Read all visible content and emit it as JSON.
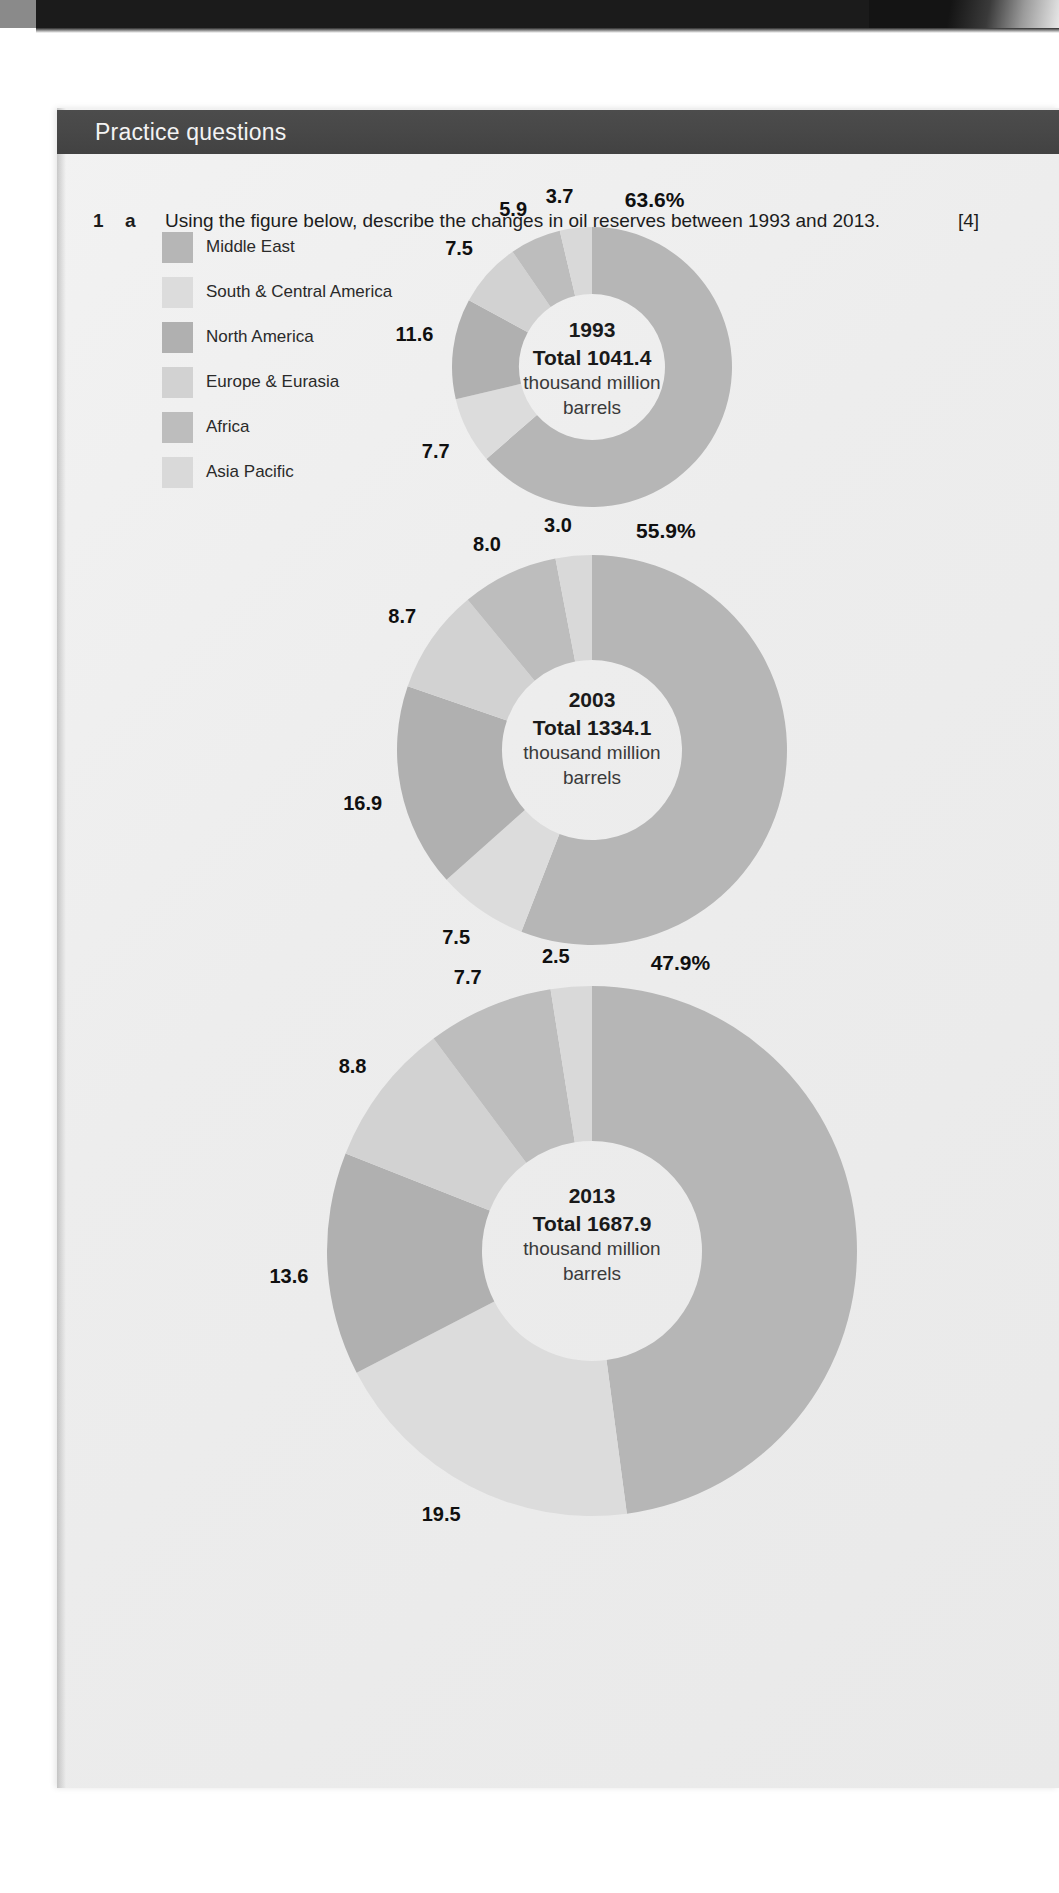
{
  "header": {
    "title": "Practice questions"
  },
  "question": {
    "number": "1",
    "sub": "a",
    "text": "Using the figure below, describe the changes in oil reserves between 1993 and 2013.",
    "marks": "[4]"
  },
  "legend": {
    "items": [
      {
        "label": "Middle East",
        "color": "#b6b6b6"
      },
      {
        "label": "South & Central America",
        "color": "#dcdcdc"
      },
      {
        "label": "North America",
        "color": "#b0b0b0"
      },
      {
        "label": "Europe & Eurasia",
        "color": "#d2d2d2"
      },
      {
        "label": "Africa",
        "color": "#bdbdbd"
      },
      {
        "label": "Asia Pacific",
        "color": "#d9d9d9"
      }
    ]
  },
  "chart_data": [
    {
      "type": "pie",
      "title": "1993",
      "center_lines": [
        "1993",
        "Total 1041.4",
        "thousand million",
        "barrels"
      ],
      "total": "1041.4",
      "unit": "thousand million barrels",
      "categories": [
        "Middle East",
        "South & Central America",
        "North America",
        "Europe & Eurasia",
        "Africa",
        "Asia Pacific"
      ],
      "values": [
        63.6,
        7.7,
        11.6,
        7.5,
        5.9,
        3.7
      ],
      "labels": [
        "63.6%",
        "7.7",
        "11.6",
        "7.5",
        "5.9",
        "3.7"
      ],
      "colors": [
        "#b6b6b6",
        "#dcdcdc",
        "#b0b0b0",
        "#d2d2d2",
        "#bdbdbd",
        "#d9d9d9"
      ],
      "legend_position": "left",
      "donut": true
    },
    {
      "type": "pie",
      "title": "2003",
      "center_lines": [
        "2003",
        "Total 1334.1",
        "thousand million",
        "barrels"
      ],
      "total": "1334.1",
      "unit": "thousand million barrels",
      "categories": [
        "Middle East",
        "South & Central America",
        "North America",
        "Europe & Eurasia",
        "Africa",
        "Asia Pacific"
      ],
      "values": [
        55.9,
        7.5,
        16.9,
        8.7,
        8.0,
        3.0
      ],
      "labels": [
        "55.9%",
        "7.5",
        "16.9",
        "8.7",
        "8.0",
        "3.0"
      ],
      "colors": [
        "#b6b6b6",
        "#dcdcdc",
        "#b0b0b0",
        "#d2d2d2",
        "#bdbdbd",
        "#d9d9d9"
      ],
      "legend_position": "left",
      "donut": true
    },
    {
      "type": "pie",
      "title": "2013",
      "center_lines": [
        "2013",
        "Total 1687.9",
        "thousand million",
        "barrels"
      ],
      "total": "1687.9",
      "unit": "thousand million barrels",
      "categories": [
        "Middle East",
        "South & Central America",
        "North America",
        "Europe & Eurasia",
        "Africa",
        "Asia Pacific"
      ],
      "values": [
        47.9,
        19.5,
        13.6,
        8.8,
        7.7,
        2.5
      ],
      "labels": [
        "47.9%",
        "19.5",
        "13.6",
        "8.8",
        "7.7",
        "2.5"
      ],
      "colors": [
        "#b6b6b6",
        "#dcdcdc",
        "#b0b0b0",
        "#d2d2d2",
        "#bdbdbd",
        "#d9d9d9"
      ],
      "legend_position": "left",
      "donut": true
    }
  ],
  "charts_layout": [
    {
      "cx": 592,
      "cy": 367,
      "r_outer": 140,
      "r_inner": 73,
      "label_r": 160,
      "center_top": 316
    },
    {
      "cx": 592,
      "cy": 750,
      "r_outer": 195,
      "r_inner": 90,
      "label_r": 214,
      "center_top": 686
    },
    {
      "cx": 592,
      "cy": 1251,
      "r_outer": 265,
      "r_inner": 110,
      "label_r": 284,
      "center_top": 1182
    }
  ]
}
